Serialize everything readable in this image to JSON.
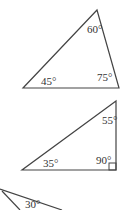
{
  "triangles": [
    {
      "name": "triangle-1",
      "angles": {
        "top": "60°",
        "bottom_left": "45°",
        "bottom_right": "75°"
      }
    },
    {
      "name": "triangle-2",
      "angles": {
        "top": "55°",
        "bottom_left": "35°",
        "right_angle": "90°"
      }
    },
    {
      "name": "triangle-3",
      "angles": {
        "partial": "30°"
      }
    }
  ],
  "colors": {
    "stroke": "#444444",
    "text": "#333333"
  }
}
